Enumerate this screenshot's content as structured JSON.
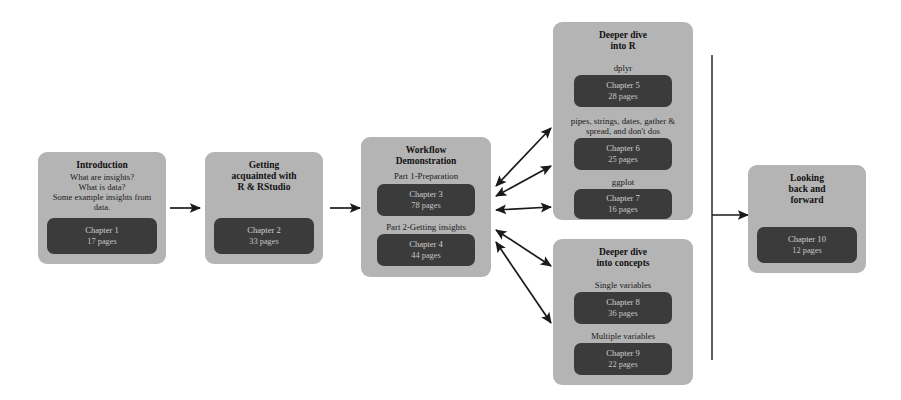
{
  "diagram": {
    "colors": {
      "panel_bg": "#b4b4b4",
      "chapter_bg": "#3b3b3b",
      "arrow": "#1a1a1a",
      "page_bg": "#ffffff"
    },
    "nodes": {
      "introduction": {
        "title": "Introduction",
        "lines": [
          "What are insights?",
          "What is data?",
          "Some example insights from",
          "data."
        ],
        "chapter": {
          "name": "Chapter 1",
          "pages": "17 pages"
        }
      },
      "getting_acquainted": {
        "title_lines": [
          "Getting",
          "acquainted with",
          "R & RStudio"
        ],
        "chapter": {
          "name": "Chapter 2",
          "pages": "33 pages"
        }
      },
      "workflow": {
        "title_lines": [
          "Workflow",
          "Demonstration"
        ],
        "parts": [
          {
            "label": "Part 1-Preparation",
            "chapter": {
              "name": "Chapter 3",
              "pages": "78 pages"
            }
          },
          {
            "label": "Part 2-Getting insights",
            "chapter": {
              "name": "Chapter 4",
              "pages": "44 pages"
            }
          }
        ]
      },
      "deeper_dive_r": {
        "title_lines": [
          "Deeper dive",
          "into R"
        ],
        "topics": [
          {
            "label_lines": [
              "dplyr"
            ],
            "chapter": {
              "name": "Chapter 5",
              "pages": "28 pages"
            }
          },
          {
            "label_lines": [
              "pipes, strings, dates, gather &",
              "spread, and don't dos"
            ],
            "chapter": {
              "name": "Chapter 6",
              "pages": "25 pages"
            }
          },
          {
            "label_lines": [
              "ggplot"
            ],
            "chapter": {
              "name": "Chapter 7",
              "pages": "16 pages"
            }
          }
        ]
      },
      "deeper_dive_concepts": {
        "title_lines": [
          "Deeper dive",
          "into concepts"
        ],
        "topics": [
          {
            "label_lines": [
              "Single variables"
            ],
            "chapter": {
              "name": "Chapter 8",
              "pages": "36 pages"
            }
          },
          {
            "label_lines": [
              "Multiple variables"
            ],
            "chapter": {
              "name": "Chapter 9",
              "pages": "22 pages"
            }
          }
        ]
      },
      "looking_back": {
        "title_lines": [
          "Looking",
          "back and",
          "forward"
        ],
        "chapter": {
          "name": "Chapter 10",
          "pages": "12 pages"
        }
      }
    }
  }
}
